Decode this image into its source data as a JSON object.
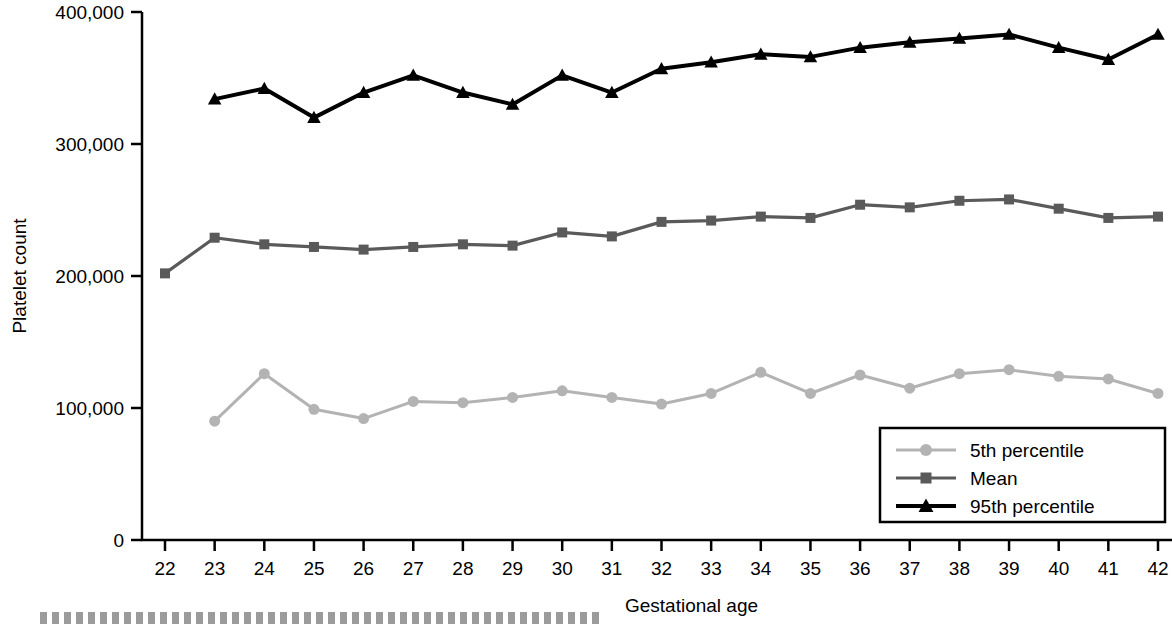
{
  "chart_data": {
    "type": "line",
    "title": "",
    "xlabel": "Gestational age",
    "ylabel": "Platelet count",
    "x": [
      22,
      23,
      24,
      25,
      26,
      27,
      28,
      29,
      30,
      31,
      32,
      33,
      34,
      35,
      36,
      37,
      38,
      39,
      40,
      41,
      42
    ],
    "xtick_labels": [
      "22",
      "23",
      "24",
      "25",
      "26",
      "27",
      "28",
      "29",
      "30",
      "31",
      "32",
      "33",
      "34",
      "35",
      "36",
      "37",
      "38",
      "39",
      "40",
      "41",
      "42"
    ],
    "ytick_labels": [
      "0",
      "100,000",
      "200,000",
      "300,000",
      "400,000"
    ],
    "ytick_values": [
      0,
      100000,
      200000,
      300000,
      400000
    ],
    "xlim": [
      21.5,
      42.5
    ],
    "ylim": [
      0,
      400000
    ],
    "grid": false,
    "legend_position": "lower-right",
    "series": [
      {
        "name": "5th percentile",
        "color": "#b3b3b3",
        "marker": "circle",
        "x": [
          23,
          24,
          25,
          26,
          27,
          28,
          29,
          30,
          31,
          32,
          33,
          34,
          35,
          36,
          37,
          38,
          39,
          40,
          41,
          42
        ],
        "values": [
          90000,
          126000,
          99000,
          92000,
          105000,
          104000,
          108000,
          113000,
          108000,
          103000,
          111000,
          127000,
          111000,
          125000,
          115000,
          126000,
          129000,
          124000,
          122000,
          111000
        ]
      },
      {
        "name": "Mean",
        "color": "#5a5a5a",
        "marker": "square",
        "x": [
          22,
          23,
          24,
          25,
          26,
          27,
          28,
          29,
          30,
          31,
          32,
          33,
          34,
          35,
          36,
          37,
          38,
          39,
          40,
          41,
          42
        ],
        "values": [
          202000,
          229000,
          224000,
          222000,
          220000,
          222000,
          224000,
          223000,
          233000,
          230000,
          241000,
          242000,
          245000,
          244000,
          254000,
          252000,
          257000,
          258000,
          251000,
          244000,
          245000
        ]
      },
      {
        "name": "95th percentile",
        "color": "#000000",
        "marker": "triangle",
        "x": [
          23,
          24,
          25,
          26,
          27,
          28,
          29,
          30,
          31,
          32,
          33,
          34,
          35,
          36,
          37,
          38,
          39,
          40,
          41,
          42
        ],
        "values": [
          334000,
          342000,
          320000,
          339000,
          352000,
          339000,
          330000,
          352000,
          339000,
          357000,
          362000,
          368000,
          366000,
          373000,
          377000,
          380000,
          383000,
          373000,
          364000,
          383000
        ]
      }
    ]
  },
  "legend": {
    "items": [
      {
        "label": "5th percentile"
      },
      {
        "label": "Mean"
      },
      {
        "label": "95th percentile"
      }
    ]
  },
  "axis": {
    "x_title": "Gestational age",
    "y_title": "Platelet count"
  }
}
